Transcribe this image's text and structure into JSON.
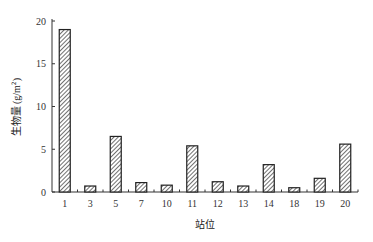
{
  "chart_data": {
    "type": "bar",
    "title": "",
    "xlabel": "站位",
    "ylabel": "生物量 (g/m²)",
    "categories": [
      "1",
      "3",
      "5",
      "7",
      "10",
      "11",
      "12",
      "13",
      "14",
      "18",
      "19",
      "20"
    ],
    "values": [
      19.0,
      0.7,
      6.5,
      1.1,
      0.8,
      5.4,
      1.2,
      0.7,
      3.2,
      0.5,
      1.6,
      5.6
    ],
    "ylim": [
      0,
      20
    ],
    "yticks": [
      0,
      5,
      10,
      15,
      20
    ],
    "grid": false,
    "legend": null,
    "bar_style": "diagonal-hatch"
  },
  "labels": {
    "xlabel": "站位",
    "ylabel_main": "生物量",
    "ylabel_unit": "(g/m",
    "ylabel_sup": "2",
    "ylabel_close": ")"
  },
  "colors": {
    "bar_edge": "#222222",
    "hatch": "#333333",
    "axis": "#333333"
  }
}
